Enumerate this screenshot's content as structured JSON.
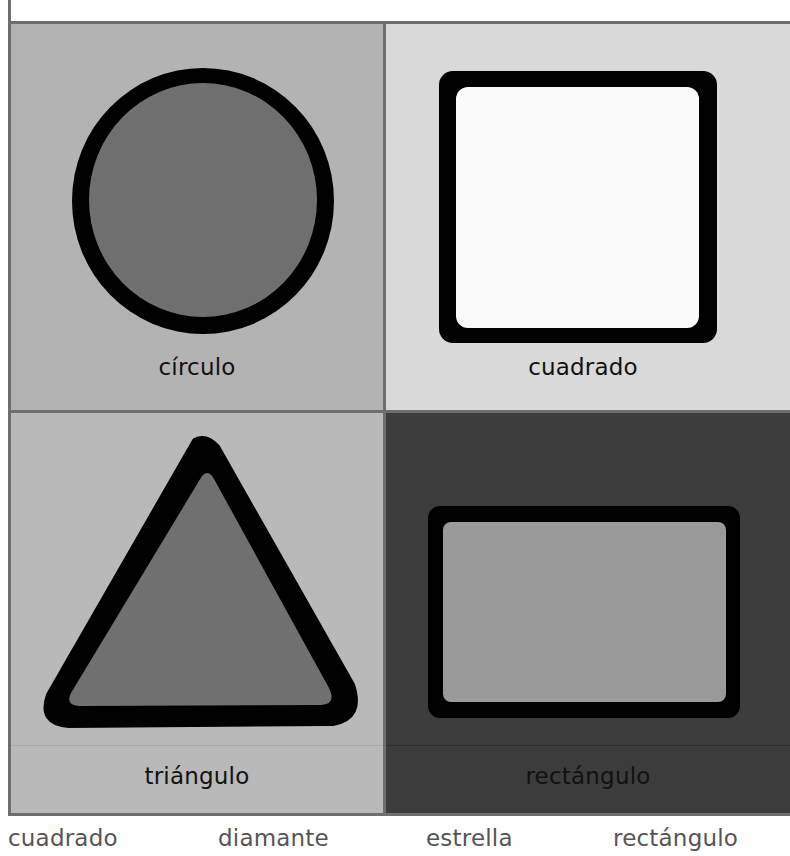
{
  "page": {
    "panels": [
      {
        "id": "circle",
        "label": "círculo",
        "shape": "circle",
        "background": "#b3b3b3",
        "fill": "#6f6f6f",
        "outline": "#000000"
      },
      {
        "id": "square",
        "label": "cuadrado",
        "shape": "square",
        "background": "#d9d9d9",
        "fill": "#fafafa",
        "outline": "#000000"
      },
      {
        "id": "triangle",
        "label": "triángulo",
        "shape": "triangle",
        "background": "#b9b9b9",
        "fill": "#707070",
        "outline": "#000000"
      },
      {
        "id": "rectangle",
        "label": "rectángulo",
        "shape": "rectangle",
        "background": "#3c3c3c",
        "fill": "#9a9a9a",
        "outline": "#000000"
      }
    ],
    "word_bank": [
      "cuadrado",
      "diamante",
      "estrella",
      "rectángulo"
    ],
    "colors": {
      "grid_border": "#6e6e6e",
      "caption_text": "#111111",
      "word_bank_text": "#555555"
    }
  }
}
